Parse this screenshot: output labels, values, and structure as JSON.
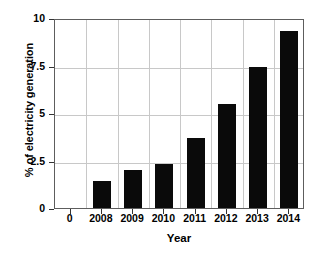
{
  "chart_data": {
    "type": "bar",
    "title": "",
    "subtitle": "",
    "xlabel": "Year",
    "ylabel": "% of electricity generation",
    "categories": [
      "2008",
      "2009",
      "2010",
      "2011",
      "2012",
      "2013",
      "2014"
    ],
    "values": [
      1.4,
      2.0,
      2.3,
      3.7,
      5.45,
      7.4,
      9.3
    ],
    "series": [
      {
        "name": "% of electricity generation",
        "values": [
          1.4,
          2.0,
          2.3,
          3.7,
          5.45,
          7.4,
          9.3
        ]
      }
    ],
    "ylim": [
      0,
      10
    ],
    "yticks": [
      "0",
      "2.5",
      "5",
      "7.5",
      "10"
    ],
    "ytick_values": [
      0,
      2.5,
      5,
      7.5,
      10
    ],
    "xtick_labels": [
      "0",
      "2008",
      "2009",
      "2010",
      "2011",
      "2012",
      "2013",
      "2014"
    ],
    "x_origin_label": "0",
    "grid": true,
    "legend": null,
    "legend_position": "none",
    "bar_color": "#0a0a0a",
    "grid_color": "#c8c8c8",
    "axis_color": "#5d5d5d",
    "background_color": "#ffffff",
    "annotations": []
  }
}
